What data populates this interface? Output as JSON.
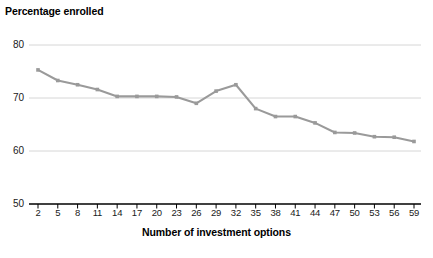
{
  "chart_data": {
    "type": "line",
    "title": "Percentage enrolled",
    "xlabel": "Number of investment options",
    "ylabel": "Percentage enrolled",
    "ylabel_lines": [
      "Percentage",
      "enrolled"
    ],
    "x": [
      2,
      5,
      8,
      11,
      14,
      17,
      20,
      23,
      26,
      29,
      32,
      35,
      38,
      41,
      44,
      47,
      50,
      53,
      56,
      59
    ],
    "values": [
      75.3,
      73.3,
      72.5,
      71.6,
      70.3,
      70.3,
      70.3,
      70.2,
      69.0,
      71.3,
      72.5,
      68.0,
      66.5,
      66.5,
      65.3,
      63.5,
      63.4,
      62.7,
      62.6,
      61.8
    ],
    "categories": [
      "2",
      "5",
      "8",
      "11",
      "14",
      "17",
      "20",
      "23",
      "26",
      "29",
      "32",
      "35",
      "38",
      "41",
      "44",
      "47",
      "50",
      "53",
      "56",
      "59"
    ],
    "xtick_labels": [
      "2",
      "5",
      "8",
      "11",
      "14",
      "17",
      "20",
      "23",
      "26",
      "29",
      "32",
      "35",
      "38",
      "41",
      "44",
      "47",
      "50",
      "53",
      "56",
      "59"
    ],
    "ytick_labels": [
      "50",
      "60",
      "70",
      "80"
    ],
    "ytick_values": [
      50,
      60,
      70,
      80
    ],
    "ylim": [
      50,
      80
    ],
    "xlim": [
      2,
      59
    ],
    "grid": "horizontal",
    "legend": "none",
    "series_color": "#9a9a9a",
    "marker": "square",
    "gridline_color": "#d6d6d6",
    "axis_color": "#000000",
    "text_color": "#1a1a1a"
  }
}
